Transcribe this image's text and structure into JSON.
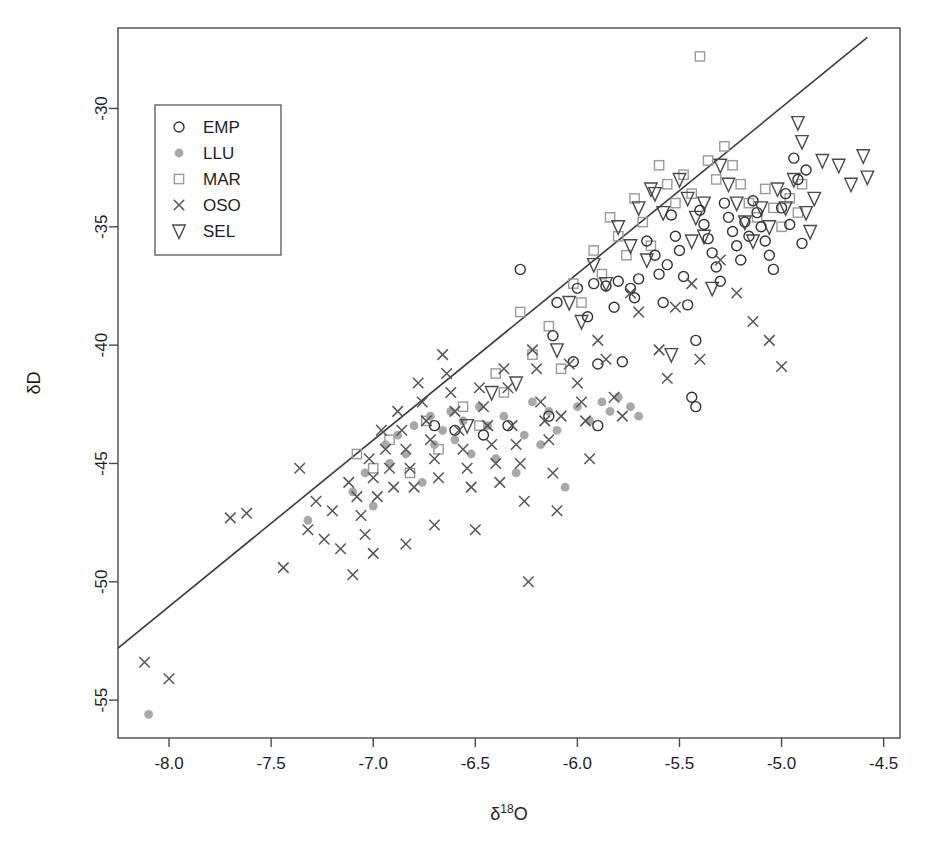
{
  "chart_data": {
    "type": "scatter",
    "title": "",
    "xlabel": "δ¹⁸O",
    "ylabel": "δD",
    "xlim": [
      -8.25,
      -4.42
    ],
    "ylim": [
      -56.6,
      -26.6
    ],
    "xticks": [
      -8.0,
      -7.5,
      -7.0,
      -6.5,
      -6.0,
      -5.5,
      -5.0,
      -4.5
    ],
    "xticklabels": [
      "-8.0",
      "-7.5",
      "-7.0",
      "-6.5",
      "-6.0",
      "-5.5",
      "-5.0",
      "-4.5"
    ],
    "yticks": [
      -55,
      -50,
      -45,
      -40,
      -35,
      -30
    ],
    "yticklabels": [
      "-55",
      "-50",
      "-45",
      "-40",
      "-35",
      "-30"
    ],
    "grid": false,
    "legend_position": "upper left",
    "legend_entries": [
      {
        "label": "EMP",
        "marker": "open-circle",
        "color": "#333333"
      },
      {
        "label": "LLU",
        "marker": "filled-circle",
        "color": "#a8a8a8"
      },
      {
        "label": "MAR",
        "marker": "open-square",
        "color": "#9a9a9a"
      },
      {
        "label": "OSO",
        "marker": "cross-x",
        "color": "#555555"
      },
      {
        "label": "SEL",
        "marker": "open-triangle-down",
        "color": "#4a4a4a"
      }
    ],
    "reference_line": {
      "name": "Global Meteoric Water Line",
      "slope": 7.0,
      "intercept": -5.0,
      "x_start": -8.25,
      "y_start": -52.8,
      "x_end": -4.58,
      "y_end": -27.0
    },
    "series": [
      {
        "name": "EMP",
        "marker": "open-circle",
        "color": "#333333",
        "points": [
          [
            -6.28,
            -36.8
          ],
          [
            -6.12,
            -39.6
          ],
          [
            -6.1,
            -38.2
          ],
          [
            -6.02,
            -40.7
          ],
          [
            -6.0,
            -37.6
          ],
          [
            -5.95,
            -38.8
          ],
          [
            -5.92,
            -37.4
          ],
          [
            -5.9,
            -40.8
          ],
          [
            -5.86,
            -37.5
          ],
          [
            -5.82,
            -38.4
          ],
          [
            -5.8,
            -37.3
          ],
          [
            -5.78,
            -40.7
          ],
          [
            -5.74,
            -37.6
          ],
          [
            -5.72,
            -38.0
          ],
          [
            -5.7,
            -37.2
          ],
          [
            -5.66,
            -35.6
          ],
          [
            -5.62,
            -36.2
          ],
          [
            -5.6,
            -37.0
          ],
          [
            -5.58,
            -38.2
          ],
          [
            -5.56,
            -36.6
          ],
          [
            -5.54,
            -34.5
          ],
          [
            -5.52,
            -35.4
          ],
          [
            -5.5,
            -36.0
          ],
          [
            -5.48,
            -37.1
          ],
          [
            -5.46,
            -38.3
          ],
          [
            -5.44,
            -42.2
          ],
          [
            -5.42,
            -42.6
          ],
          [
            -5.4,
            -34.3
          ],
          [
            -5.38,
            -34.9
          ],
          [
            -5.36,
            -35.5
          ],
          [
            -5.34,
            -36.1
          ],
          [
            -5.32,
            -36.7
          ],
          [
            -5.3,
            -37.3
          ],
          [
            -5.28,
            -34.0
          ],
          [
            -5.26,
            -34.6
          ],
          [
            -5.24,
            -35.2
          ],
          [
            -5.22,
            -35.8
          ],
          [
            -5.2,
            -36.4
          ],
          [
            -5.18,
            -34.8
          ],
          [
            -5.16,
            -35.4
          ],
          [
            -5.14,
            -33.9
          ],
          [
            -5.12,
            -34.4
          ],
          [
            -5.1,
            -35.0
          ],
          [
            -5.08,
            -35.6
          ],
          [
            -5.06,
            -36.2
          ],
          [
            -5.04,
            -36.8
          ],
          [
            -5.0,
            -34.2
          ],
          [
            -4.98,
            -33.6
          ],
          [
            -4.96,
            -34.9
          ],
          [
            -4.94,
            -32.1
          ],
          [
            -4.92,
            -33.0
          ],
          [
            -4.9,
            -35.7
          ],
          [
            -4.88,
            -32.6
          ],
          [
            -5.42,
            -39.8
          ],
          [
            -5.9,
            -43.4
          ],
          [
            -6.14,
            -43.0
          ],
          [
            -6.34,
            -43.4
          ],
          [
            -6.46,
            -43.8
          ],
          [
            -6.6,
            -43.6
          ],
          [
            -6.7,
            -43.4
          ]
        ]
      },
      {
        "name": "LLU",
        "marker": "filled-circle",
        "color": "#a8a8a8",
        "points": [
          [
            -8.1,
            -55.6
          ],
          [
            -7.32,
            -47.4
          ],
          [
            -7.1,
            -46.2
          ],
          [
            -7.04,
            -45.4
          ],
          [
            -7.0,
            -46.8
          ],
          [
            -6.94,
            -44.2
          ],
          [
            -6.92,
            -45.0
          ],
          [
            -6.88,
            -43.8
          ],
          [
            -6.84,
            -44.6
          ],
          [
            -6.8,
            -43.4
          ],
          [
            -6.76,
            -45.8
          ],
          [
            -6.72,
            -43.0
          ],
          [
            -6.7,
            -44.2
          ],
          [
            -6.66,
            -43.6
          ],
          [
            -6.62,
            -42.8
          ],
          [
            -6.6,
            -44.0
          ],
          [
            -6.56,
            -43.2
          ],
          [
            -6.52,
            -44.6
          ],
          [
            -6.48,
            -42.6
          ],
          [
            -6.44,
            -43.4
          ],
          [
            -6.4,
            -44.8
          ],
          [
            -6.36,
            -43.0
          ],
          [
            -6.3,
            -45.4
          ],
          [
            -6.26,
            -43.8
          ],
          [
            -6.22,
            -42.4
          ],
          [
            -6.18,
            -44.2
          ],
          [
            -6.14,
            -42.8
          ],
          [
            -6.1,
            -43.6
          ],
          [
            -6.06,
            -46.0
          ],
          [
            -6.0,
            -42.6
          ],
          [
            -5.94,
            -43.2
          ],
          [
            -5.88,
            -42.4
          ],
          [
            -5.84,
            -42.8
          ],
          [
            -5.8,
            -42.2
          ],
          [
            -5.74,
            -42.6
          ],
          [
            -5.7,
            -43.0
          ]
        ]
      },
      {
        "name": "MAR",
        "marker": "open-square",
        "color": "#9a9a9a",
        "points": [
          [
            -7.08,
            -44.6
          ],
          [
            -7.0,
            -45.2
          ],
          [
            -6.92,
            -44.0
          ],
          [
            -6.82,
            -45.4
          ],
          [
            -6.74,
            -43.2
          ],
          [
            -6.68,
            -44.4
          ],
          [
            -6.56,
            -42.6
          ],
          [
            -6.48,
            -43.4
          ],
          [
            -6.4,
            -41.2
          ],
          [
            -6.36,
            -42.0
          ],
          [
            -6.28,
            -38.6
          ],
          [
            -6.22,
            -40.4
          ],
          [
            -6.14,
            -39.2
          ],
          [
            -6.08,
            -41.0
          ],
          [
            -6.02,
            -37.4
          ],
          [
            -5.98,
            -38.2
          ],
          [
            -5.92,
            -36.0
          ],
          [
            -5.88,
            -37.0
          ],
          [
            -5.84,
            -34.6
          ],
          [
            -5.8,
            -35.4
          ],
          [
            -5.76,
            -36.2
          ],
          [
            -5.72,
            -33.8
          ],
          [
            -5.68,
            -34.8
          ],
          [
            -5.64,
            -35.8
          ],
          [
            -5.6,
            -32.4
          ],
          [
            -5.56,
            -33.2
          ],
          [
            -5.52,
            -34.0
          ],
          [
            -5.48,
            -32.8
          ],
          [
            -5.44,
            -33.6
          ],
          [
            -5.4,
            -27.8
          ],
          [
            -5.36,
            -32.2
          ],
          [
            -5.32,
            -33.0
          ],
          [
            -5.28,
            -31.6
          ],
          [
            -5.24,
            -32.4
          ],
          [
            -5.2,
            -33.2
          ],
          [
            -5.16,
            -34.0
          ],
          [
            -5.12,
            -34.6
          ],
          [
            -5.08,
            -33.4
          ],
          [
            -5.04,
            -34.2
          ],
          [
            -5.0,
            -35.0
          ],
          [
            -4.96,
            -33.8
          ],
          [
            -4.92,
            -34.4
          ],
          [
            -4.9,
            -33.2
          ]
        ]
      },
      {
        "name": "OSO",
        "marker": "cross-x",
        "color": "#555555",
        "points": [
          [
            -8.12,
            -53.4
          ],
          [
            -8.0,
            -54.1
          ],
          [
            -7.7,
            -47.3
          ],
          [
            -7.62,
            -47.1
          ],
          [
            -7.44,
            -49.4
          ],
          [
            -7.36,
            -45.2
          ],
          [
            -7.32,
            -47.8
          ],
          [
            -7.28,
            -46.6
          ],
          [
            -7.24,
            -48.2
          ],
          [
            -7.2,
            -47.0
          ],
          [
            -7.16,
            -48.6
          ],
          [
            -7.12,
            -45.8
          ],
          [
            -7.1,
            -49.7
          ],
          [
            -7.08,
            -46.4
          ],
          [
            -7.06,
            -47.2
          ],
          [
            -7.04,
            -48.0
          ],
          [
            -7.02,
            -44.8
          ],
          [
            -7.0,
            -45.6
          ],
          [
            -6.98,
            -46.4
          ],
          [
            -6.96,
            -43.6
          ],
          [
            -6.94,
            -44.4
          ],
          [
            -6.92,
            -45.2
          ],
          [
            -6.9,
            -46.0
          ],
          [
            -6.88,
            -42.8
          ],
          [
            -6.86,
            -43.6
          ],
          [
            -6.84,
            -44.4
          ],
          [
            -6.82,
            -45.2
          ],
          [
            -6.8,
            -46.0
          ],
          [
            -6.78,
            -41.6
          ],
          [
            -6.76,
            -42.4
          ],
          [
            -6.74,
            -43.2
          ],
          [
            -6.72,
            -44.0
          ],
          [
            -6.7,
            -44.8
          ],
          [
            -6.68,
            -45.6
          ],
          [
            -6.66,
            -40.4
          ],
          [
            -6.64,
            -41.2
          ],
          [
            -6.62,
            -42.0
          ],
          [
            -6.6,
            -42.8
          ],
          [
            -6.58,
            -43.6
          ],
          [
            -6.56,
            -44.4
          ],
          [
            -6.54,
            -45.2
          ],
          [
            -6.52,
            -46.0
          ],
          [
            -6.5,
            -47.8
          ],
          [
            -6.48,
            -41.8
          ],
          [
            -6.46,
            -42.6
          ],
          [
            -6.44,
            -43.4
          ],
          [
            -6.42,
            -44.2
          ],
          [
            -6.4,
            -45.0
          ],
          [
            -6.38,
            -45.8
          ],
          [
            -6.36,
            -41.0
          ],
          [
            -6.34,
            -41.8
          ],
          [
            -6.32,
            -43.4
          ],
          [
            -6.3,
            -44.2
          ],
          [
            -6.28,
            -45.0
          ],
          [
            -6.26,
            -46.6
          ],
          [
            -6.24,
            -50.0
          ],
          [
            -6.22,
            -40.2
          ],
          [
            -6.2,
            -41.0
          ],
          [
            -6.18,
            -42.4
          ],
          [
            -6.16,
            -43.2
          ],
          [
            -6.14,
            -44.0
          ],
          [
            -6.12,
            -45.4
          ],
          [
            -6.1,
            -47.0
          ],
          [
            -6.08,
            -43.0
          ],
          [
            -6.04,
            -40.8
          ],
          [
            -6.0,
            -41.6
          ],
          [
            -5.98,
            -42.4
          ],
          [
            -5.96,
            -43.2
          ],
          [
            -5.94,
            -44.8
          ],
          [
            -5.9,
            -39.8
          ],
          [
            -5.86,
            -40.6
          ],
          [
            -5.82,
            -42.2
          ],
          [
            -5.78,
            -43.0
          ],
          [
            -5.74,
            -37.8
          ],
          [
            -5.7,
            -38.6
          ],
          [
            -5.6,
            -40.2
          ],
          [
            -5.56,
            -41.4
          ],
          [
            -5.52,
            -38.4
          ],
          [
            -5.44,
            -37.4
          ],
          [
            -5.4,
            -40.6
          ],
          [
            -5.3,
            -36.4
          ],
          [
            -5.22,
            -37.8
          ],
          [
            -5.14,
            -39.0
          ],
          [
            -5.06,
            -39.8
          ],
          [
            -5.0,
            -40.9
          ],
          [
            -6.84,
            -48.4
          ],
          [
            -7.0,
            -48.8
          ],
          [
            -6.7,
            -47.6
          ]
        ]
      },
      {
        "name": "SEL",
        "marker": "open-triangle-down",
        "color": "#4a4a4a",
        "points": [
          [
            -6.54,
            -43.4
          ],
          [
            -6.42,
            -42.0
          ],
          [
            -6.3,
            -41.6
          ],
          [
            -6.1,
            -40.2
          ],
          [
            -6.04,
            -38.2
          ],
          [
            -5.98,
            -39.0
          ],
          [
            -5.92,
            -36.6
          ],
          [
            -5.86,
            -37.4
          ],
          [
            -5.8,
            -35.0
          ],
          [
            -5.74,
            -35.8
          ],
          [
            -5.7,
            -34.2
          ],
          [
            -5.66,
            -36.4
          ],
          [
            -5.62,
            -33.6
          ],
          [
            -5.58,
            -34.4
          ],
          [
            -5.54,
            -40.4
          ],
          [
            -5.5,
            -33.0
          ],
          [
            -5.46,
            -33.8
          ],
          [
            -5.42,
            -34.6
          ],
          [
            -5.38,
            -35.4
          ],
          [
            -5.34,
            -37.6
          ],
          [
            -5.3,
            -32.4
          ],
          [
            -5.26,
            -33.2
          ],
          [
            -5.22,
            -34.0
          ],
          [
            -5.18,
            -34.8
          ],
          [
            -5.14,
            -35.6
          ],
          [
            -5.1,
            -34.2
          ],
          [
            -5.06,
            -35.0
          ],
          [
            -5.02,
            -33.4
          ],
          [
            -4.98,
            -34.2
          ],
          [
            -4.94,
            -33.0
          ],
          [
            -4.92,
            -30.6
          ],
          [
            -4.9,
            -31.4
          ],
          [
            -4.88,
            -34.4
          ],
          [
            -4.86,
            -35.2
          ],
          [
            -4.84,
            -33.8
          ],
          [
            -4.8,
            -32.2
          ],
          [
            -4.72,
            -32.4
          ],
          [
            -4.66,
            -33.2
          ],
          [
            -4.6,
            -32.0
          ],
          [
            -4.58,
            -32.9
          ],
          [
            -5.64,
            -33.4
          ],
          [
            -5.44,
            -35.6
          ],
          [
            -5.38,
            -34.0
          ]
        ]
      }
    ]
  }
}
